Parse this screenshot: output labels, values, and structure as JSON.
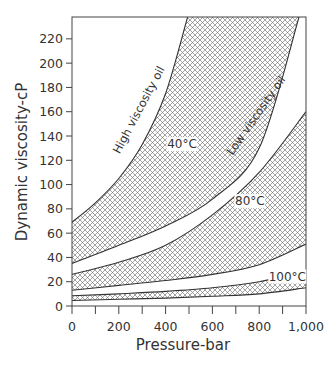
{
  "chart_data": {
    "type": "area",
    "title": "",
    "xlabel": "Pressure-bar",
    "ylabel": "Dynamic viscosity-cP",
    "xlim": [
      0,
      1000
    ],
    "ylim": [
      0,
      238
    ],
    "x_ticks": [
      0,
      100,
      200,
      300,
      400,
      500,
      600,
      700,
      800,
      900,
      1000
    ],
    "x_tick_labels": [
      {
        "value": 0,
        "label": "0"
      },
      {
        "value": 200,
        "label": "200"
      },
      {
        "value": 400,
        "label": "400"
      },
      {
        "value": 600,
        "label": "600"
      },
      {
        "value": 800,
        "label": "800"
      },
      {
        "value": 1000,
        "label": "1,000"
      }
    ],
    "y_ticks": [
      0,
      20,
      40,
      60,
      80,
      100,
      120,
      140,
      160,
      180,
      200,
      220
    ],
    "y_tick_labels": [
      "0",
      "20",
      "40",
      "60",
      "80",
      "100",
      "120",
      "140",
      "160",
      "180",
      "200",
      "220"
    ],
    "grid": false,
    "fill_pattern": "crosshatch",
    "series": [
      {
        "name": "40°C",
        "band_label": "40°C",
        "upper": {
          "name": "High viscosity oil",
          "x": [
            0,
            100,
            200,
            300,
            400,
            494
          ],
          "y": [
            69,
            85,
            105,
            133,
            175,
            238
          ]
        },
        "lower": {
          "name": "Low viscosity oil",
          "x": [
            0,
            200,
            400,
            600,
            800,
            970
          ],
          "y": [
            35,
            50,
            66,
            88,
            130,
            238
          ]
        }
      },
      {
        "name": "80°C",
        "band_label": "80°C",
        "upper": {
          "x": [
            0,
            200,
            400,
            600,
            800,
            1000
          ],
          "y": [
            26,
            36,
            50,
            75,
            110,
            160
          ]
        },
        "lower": {
          "x": [
            0,
            200,
            400,
            600,
            800,
            1000
          ],
          "y": [
            13,
            17,
            21,
            26,
            34,
            51
          ]
        }
      },
      {
        "name": "100°C",
        "band_label": "100°C",
        "upper": {
          "x": [
            0,
            200,
            400,
            600,
            800,
            1000
          ],
          "y": [
            8.5,
            10,
            12,
            15,
            20,
            29
          ]
        },
        "lower": {
          "x": [
            0,
            200,
            400,
            600,
            800,
            1000
          ],
          "y": [
            4.5,
            5.5,
            6.5,
            8,
            10,
            15
          ]
        }
      }
    ],
    "annotations": [
      {
        "text": "High viscosity oil",
        "x": 300,
        "y": 160,
        "rotation": -62
      },
      {
        "text": "Low viscosity oil",
        "x": 800,
        "y": 155,
        "rotation": -55
      },
      {
        "text": "40°C",
        "x": 470,
        "y": 130
      },
      {
        "text": "80°C",
        "x": 760,
        "y": 83
      },
      {
        "text": "100°C",
        "x": 920,
        "y": 21
      }
    ]
  },
  "colors": {
    "line": "#333333",
    "hatch": "#555555",
    "background": "#ffffff"
  }
}
